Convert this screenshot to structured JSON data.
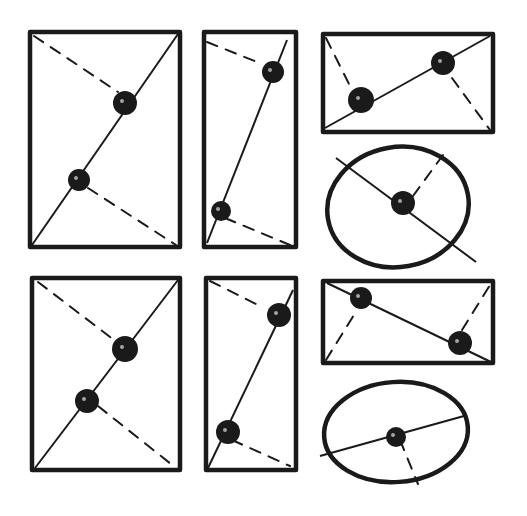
{
  "diagram": {
    "ink_color": "#1a1a1a",
    "background": "#ffffff",
    "panels": [
      {
        "id": "tall-rect-1",
        "shape": "rect",
        "x": 30,
        "y": 32,
        "w": 150,
        "h": 215,
        "solid": [
          [
            32,
            245
          ],
          [
            178,
            34
          ]
        ],
        "dashed": [
          [
            [
              34,
              36
            ],
            [
              118,
              92
            ]
          ],
          [
            [
              88,
              188
            ],
            [
              176,
              245
            ]
          ]
        ],
        "dots": [
          [
            125,
            103,
            12
          ],
          [
            79,
            180,
            11
          ]
        ]
      },
      {
        "id": "narrow-rect-1",
        "shape": "rect",
        "x": 204,
        "y": 32,
        "w": 92,
        "h": 215,
        "solid": [
          [
            207,
            243
          ],
          [
            287,
            40
          ]
        ],
        "dashed": [
          [
            [
              207,
              42
            ],
            [
              262,
              64
            ]
          ],
          [
            [
              225,
              218
            ],
            [
              290,
              245
            ]
          ]
        ],
        "dots": [
          [
            273,
            72,
            11
          ],
          [
            221,
            211,
            10
          ]
        ]
      },
      {
        "id": "wide-rect-1",
        "shape": "rect",
        "x": 323,
        "y": 34,
        "w": 170,
        "h": 98,
        "solid": [
          [
            325,
            128
          ],
          [
            490,
            36
          ]
        ],
        "dashed": [
          [
            [
              326,
              38
            ],
            [
              352,
              90
            ]
          ],
          [
            [
              452,
              78
            ],
            [
              490,
              130
            ]
          ]
        ],
        "dots": [
          [
            361,
            100,
            13
          ],
          [
            443,
            63,
            12
          ]
        ]
      },
      {
        "id": "ellipse-1",
        "shape": "ellipse",
        "cx": 398,
        "cy": 207,
        "rx": 71,
        "ry": 60,
        "rotate": -10,
        "solid": [
          [
            336,
            158
          ],
          [
            476,
            262
          ]
        ],
        "dashed": [
          [
            [
              413,
              196
            ],
            [
              443,
              155
            ]
          ]
        ],
        "dots": [
          [
            403,
            203,
            12
          ]
        ]
      },
      {
        "id": "tall-rect-2",
        "shape": "rect",
        "x": 32,
        "y": 278,
        "w": 148,
        "h": 192,
        "solid": [
          [
            35,
            468
          ],
          [
            178,
            280
          ]
        ],
        "dashed": [
          [
            [
              38,
              282
            ],
            [
              118,
              343
            ]
          ],
          [
            [
              98,
              406
            ],
            [
              176,
              468
            ]
          ]
        ],
        "dots": [
          [
            125,
            349,
            13
          ],
          [
            87,
            401,
            12
          ]
        ]
      },
      {
        "id": "narrow-rect-2",
        "shape": "rect",
        "x": 206,
        "y": 278,
        "w": 90,
        "h": 192,
        "solid": [
          [
            208,
            468
          ],
          [
            293,
            290
          ]
        ],
        "dashed": [
          [
            [
              210,
              281
            ],
            [
              262,
              307
            ]
          ],
          [
            [
              232,
              440
            ],
            [
              290,
              466
            ]
          ]
        ],
        "dots": [
          [
            279,
            315,
            12
          ],
          [
            228,
            432,
            12
          ]
        ]
      },
      {
        "id": "wide-rect-2",
        "shape": "rect",
        "x": 323,
        "y": 281,
        "w": 170,
        "h": 82,
        "solid": [
          [
            327,
            283
          ],
          [
            491,
            362
          ]
        ],
        "dashed": [
          [
            [
              326,
              360
            ],
            [
              357,
              310
            ]
          ],
          [
            [
              462,
              330
            ],
            [
              490,
              285
            ]
          ]
        ],
        "dots": [
          [
            361,
            298,
            11
          ],
          [
            460,
            343,
            12
          ]
        ]
      },
      {
        "id": "ellipse-2",
        "shape": "ellipse",
        "cx": 396,
        "cy": 432,
        "rx": 72,
        "ry": 50,
        "rotate": -4,
        "solid": [
          [
            320,
            456
          ],
          [
            464,
            416
          ]
        ],
        "dashed": [
          [
            [
              400,
              440
            ],
            [
              418,
              484
            ]
          ]
        ],
        "dots": [
          [
            396,
            437,
            10
          ]
        ]
      }
    ]
  }
}
